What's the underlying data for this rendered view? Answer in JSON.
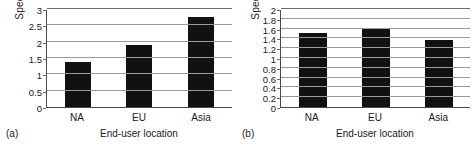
{
  "figure": {
    "background": "#ffffff",
    "bar_color": "#111111",
    "grid_color": "#9a9a9a",
    "axis_color": "#4a4a4a"
  },
  "panels": [
    {
      "caption": "(a)",
      "ylabel": "Speedup",
      "xlabel": "End-user location",
      "yticks": [
        "3",
        "2.5",
        "2",
        "1.5",
        "1",
        "0.5",
        "0"
      ],
      "categories": [
        "NA",
        "EU",
        "Asia"
      ],
      "values": [
        1.37,
        1.9,
        2.76
      ]
    },
    {
      "caption": "(b)",
      "ylabel": "Speedup",
      "xlabel": "End-user location",
      "yticks": [
        "2",
        "1.8",
        "1.6",
        "1.4",
        "1.2",
        "1",
        "0.8",
        "0.6",
        "0.4",
        "0.2",
        "0"
      ],
      "categories": [
        "NA",
        "EU",
        "Asia"
      ],
      "values": [
        1.51,
        1.6,
        1.36
      ]
    }
  ],
  "chart_data": [
    {
      "type": "bar",
      "panel": "(a)",
      "categories": [
        "NA",
        "EU",
        "Asia"
      ],
      "values": [
        1.37,
        1.9,
        2.76
      ],
      "title": "",
      "xlabel": "End-user location",
      "ylabel": "Speedup",
      "ylim": [
        0,
        3
      ],
      "ytick_step": 0.5,
      "yticks": [
        0,
        0.5,
        1,
        1.5,
        2,
        2.5,
        3
      ],
      "grid": "horizontal",
      "legend": "none",
      "bar_color": "#111111"
    },
    {
      "type": "bar",
      "panel": "(b)",
      "categories": [
        "NA",
        "EU",
        "Asia"
      ],
      "values": [
        1.51,
        1.6,
        1.36
      ],
      "title": "",
      "xlabel": "End-user location",
      "ylabel": "Speedup",
      "ylim": [
        0,
        2
      ],
      "ytick_step": 0.2,
      "yticks": [
        0,
        0.2,
        0.4,
        0.6,
        0.8,
        1,
        1.2,
        1.4,
        1.6,
        1.8,
        2
      ],
      "grid": "horizontal",
      "legend": "none",
      "bar_color": "#111111"
    }
  ]
}
